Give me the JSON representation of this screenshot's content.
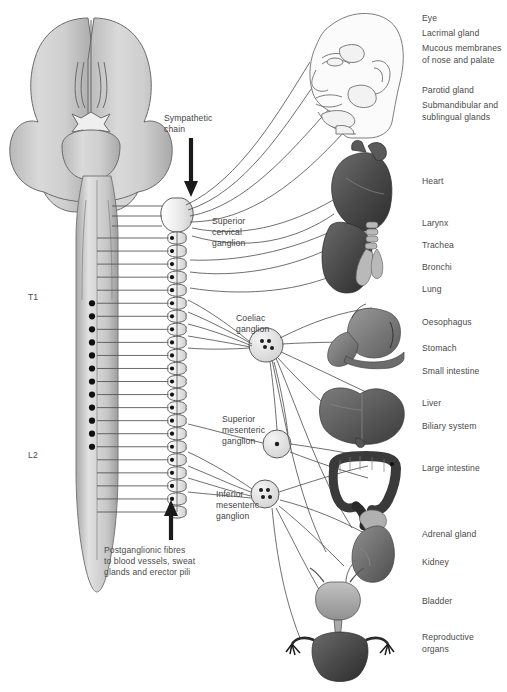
{
  "figure": {
    "background_color": "#ffffff",
    "line_color": "#4a4a4a",
    "text_color": "#4a4a4a"
  },
  "spinal_labels": [
    {
      "text": "T1",
      "x": 28,
      "y": 292
    },
    {
      "text": "L2",
      "x": 28,
      "y": 450
    }
  ],
  "center_labels": [
    {
      "name": "sympathetic-chain",
      "line1": "Sympathetic",
      "line2": "chain",
      "x": 164,
      "y": 113
    },
    {
      "name": "superior-cervical-ganglion",
      "line1": "Superior",
      "line2": "cervical",
      "line3": "ganglion",
      "x": 212,
      "y": 216
    },
    {
      "name": "coeliac-ganglion",
      "line1": "Coeliac",
      "line2": "ganglion",
      "x": 236,
      "y": 313
    },
    {
      "name": "superior-mesenteric-ganglion",
      "line1": "Superior",
      "line2": "mesenteric",
      "line3": "ganglion",
      "x": 222,
      "y": 414
    },
    {
      "name": "inferior-mesenteric-ganglion",
      "line1": "Inferior",
      "line2": "mesenteric",
      "line3": "ganglion",
      "x": 216,
      "y": 489
    }
  ],
  "caption": {
    "name": "postganglionic-fibres-caption",
    "line1": "Postganglionic fibres",
    "line2": "to blood vessels, sweat",
    "line3": "glands and erector pili",
    "x": 104,
    "y": 545
  },
  "organ_labels": [
    {
      "name": "label-eye",
      "text": "Eye",
      "x": 422,
      "y": 13
    },
    {
      "name": "label-lacrimal-gland",
      "text": "Lacrimal gland",
      "x": 422,
      "y": 28
    },
    {
      "name": "label-mucous-membranes",
      "text": "Mucous membranes",
      "x": 422,
      "y": 43
    },
    {
      "name": "label-mucous-membranes-2",
      "text": "of nose and palate",
      "x": 422,
      "y": 55
    },
    {
      "name": "label-parotid-gland",
      "text": "Parotid gland",
      "x": 422,
      "y": 85
    },
    {
      "name": "label-submandibular",
      "text": "Submandibular and",
      "x": 422,
      "y": 100
    },
    {
      "name": "label-sublingual-glands",
      "text": "sublingual glands",
      "x": 422,
      "y": 112
    },
    {
      "name": "label-heart",
      "text": "Heart",
      "x": 422,
      "y": 176
    },
    {
      "name": "label-larynx",
      "text": "Larynx",
      "x": 422,
      "y": 218
    },
    {
      "name": "label-trachea",
      "text": "Trachea",
      "x": 422,
      "y": 240
    },
    {
      "name": "label-bronchi",
      "text": "Bronchi",
      "x": 422,
      "y": 262
    },
    {
      "name": "label-lung",
      "text": "Lung",
      "x": 422,
      "y": 284
    },
    {
      "name": "label-oesophagus",
      "text": "Oesophagus",
      "x": 422,
      "y": 317
    },
    {
      "name": "label-stomach",
      "text": "Stomach",
      "x": 422,
      "y": 343
    },
    {
      "name": "label-small-intestine",
      "text": "Small intestine",
      "x": 422,
      "y": 366
    },
    {
      "name": "label-liver",
      "text": "Liver",
      "x": 422,
      "y": 398
    },
    {
      "name": "label-biliary-system",
      "text": "Biliary system",
      "x": 422,
      "y": 421
    },
    {
      "name": "label-large-intestine",
      "text": "Large intestine",
      "x": 422,
      "y": 463
    },
    {
      "name": "label-adrenal-gland",
      "text": "Adrenal gland",
      "x": 422,
      "y": 529
    },
    {
      "name": "label-kidney",
      "text": "Kidney",
      "x": 422,
      "y": 557
    },
    {
      "name": "label-bladder",
      "text": "Bladder",
      "x": 422,
      "y": 596
    },
    {
      "name": "label-reproductive-organs",
      "text": "Reproductive",
      "x": 422,
      "y": 632
    },
    {
      "name": "label-reproductive-organs-2",
      "text": "organs",
      "x": 422,
      "y": 644
    }
  ],
  "anatomy": {
    "brain": "brain-superior-view",
    "spinal_cord": "spinal-cord",
    "chain_ganglia_count": 22,
    "organs": [
      "head-face",
      "heart",
      "lung-trachea",
      "stomach-oesophagus",
      "liver",
      "large-intestine",
      "kidney-adrenal",
      "bladder",
      "reproductive-organs"
    ]
  }
}
